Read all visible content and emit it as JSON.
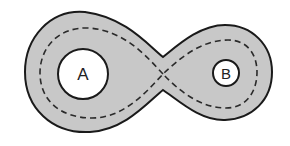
{
  "diagram": {
    "colors": {
      "background": "#ffffff",
      "band_fill": "#c8c8c8",
      "outline": "#1a1a1a",
      "hole_fill": "#ffffff",
      "dashed_curve": "#2a2a2a"
    },
    "holes": [
      {
        "label": "A",
        "cx": 83,
        "cy": 74,
        "r": 25
      },
      {
        "label": "B",
        "cx": 226,
        "cy": 73,
        "r": 13
      }
    ],
    "dashed_curve": {
      "style": "dashed",
      "self_intersection": {
        "x": 163,
        "y": 74
      }
    }
  }
}
